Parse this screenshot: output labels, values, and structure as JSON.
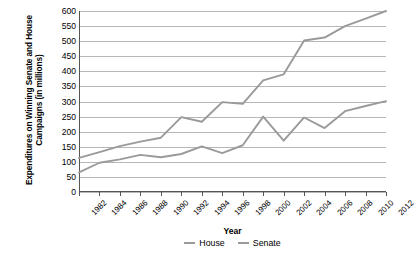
{
  "chart_data": {
    "type": "line",
    "title": "",
    "xlabel": "Year",
    "ylabel": "Expenditures on Winning Senate and House Campaigns (in millions)",
    "x": [
      1982,
      1984,
      1986,
      1988,
      1990,
      1992,
      1994,
      1996,
      1998,
      2000,
      2002,
      2004,
      2006,
      2008,
      2010,
      2012
    ],
    "xtick_labels": [
      "1982",
      "1984",
      "1986",
      "1988",
      "1990",
      "1992",
      "1994",
      "1996",
      "1998",
      "2000",
      "2002",
      "2004",
      "2006",
      "2008",
      "2010",
      "2012"
    ],
    "ytick_labels": [
      "600",
      "550",
      "500",
      "450",
      "400",
      "350",
      "300",
      "250",
      "200",
      "150",
      "100",
      "50",
      "0"
    ],
    "ytick_values": [
      600,
      550,
      500,
      450,
      400,
      350,
      300,
      250,
      200,
      150,
      100,
      50,
      0
    ],
    "ylim": [
      0,
      600
    ],
    "grid": true,
    "legend_position": "bottom-center",
    "series": [
      {
        "name": "House",
        "color": "#9a9a9a",
        "values": [
          113,
          132,
          152,
          167,
          180,
          248,
          233,
          298,
          292,
          370,
          390,
          502,
          512,
          550,
          575,
          600
        ]
      },
      {
        "name": "Senate",
        "color": "#9a9a9a",
        "values": [
          65,
          97,
          108,
          123,
          115,
          126,
          151,
          129,
          155,
          250,
          170,
          247,
          212,
          268,
          285,
          301
        ]
      }
    ]
  },
  "legend": {
    "items": [
      {
        "label": "House",
        "color": "#9a9a9a"
      },
      {
        "label": "Senate",
        "color": "#9a9a9a"
      }
    ]
  },
  "colors": {
    "line": "#9a9a9a",
    "grid": "#b7b7b7",
    "axis": "#555555",
    "text": "#000000",
    "background": "#ffffff"
  }
}
